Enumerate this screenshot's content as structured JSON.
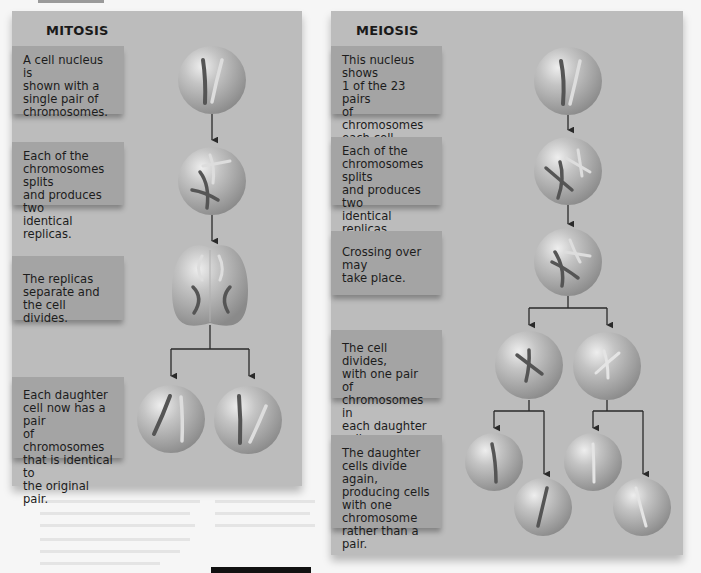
{
  "mitosis": {
    "title": "MITOSIS",
    "steps": [
      {
        "text": "A cell nucleus is\nshown with a\nsingle pair of\nchromosomes."
      },
      {
        "text": "Each of the\nchromosomes splits\nand produces two\nidentical replicas."
      },
      {
        "text": "The replicas\nseparate and\nthe cell divides."
      },
      {
        "text": "Each daughter\ncell now has a pair\nof chromosomes\nthat is identical to\nthe original pair."
      }
    ]
  },
  "meiosis": {
    "title": "MEIOSIS",
    "steps": [
      {
        "text": "This nucleus shows\n1 of the 23 pairs\nof chromosomes\neach cell contains."
      },
      {
        "text": "Each of the\nchromosomes splits\nand produces two\nidentical replicas."
      },
      {
        "text": "Crossing over may\ntake place."
      },
      {
        "text": "The cell divides,\nwith one pair of\nchromosomes in\neach daughter cell."
      },
      {
        "text": "The daughter\ncells divide again,\nproducing cells\nwith one\nchromosome\nrather than a pair."
      }
    ]
  },
  "colors": {
    "panel": "#bcbcbc",
    "label_box": "#a4a4a4",
    "arrow": "#2a2a2a",
    "chromosome_dark": "#555555",
    "chromosome_light": "#dddddd"
  }
}
